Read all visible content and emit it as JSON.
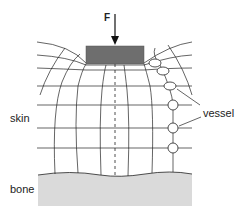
{
  "diagram": {
    "title": "",
    "labels": {
      "force": "F",
      "skin": "skin",
      "bone": "bone",
      "vessel": "vessel"
    },
    "colors": {
      "line": "#222222",
      "block": "#6e6e6e",
      "bone_fill": "#d9d9d9",
      "background": "#ffffff"
    },
    "elements": {
      "force_arrow": "downward force F applied to a block on the skin surface",
      "block": "indenter pressing skin",
      "grid": "deformed tissue mesh between skin surface and bone",
      "centerline": "dashed vertical center line",
      "vessels": 6
    }
  }
}
